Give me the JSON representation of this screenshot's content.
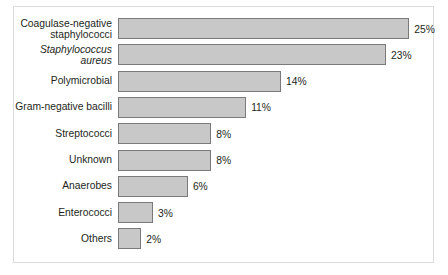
{
  "chart_data": {
    "type": "bar",
    "orientation": "horizontal",
    "title": "",
    "subtitle": "",
    "xlabel": "",
    "ylabel": "",
    "grid": false,
    "legend": null,
    "xlim": [
      0,
      25
    ],
    "value_suffix": "%",
    "categories": [
      "Coagulase-negative\nstaphylococci",
      "Staphylococcus\naureus",
      "Polymicrobial",
      "Gram-negative bacilli",
      "Streptococci",
      "Unknown",
      "Anaerobes",
      "Enterococci",
      "Others"
    ],
    "values": [
      25,
      23,
      14,
      11,
      8,
      8,
      6,
      3,
      2
    ],
    "value_labels": [
      "25%",
      "23%",
      "14%",
      "11%",
      "8%",
      "8%",
      "6%",
      "3%",
      "2%"
    ],
    "italic_categories": [
      "Staphylococcus\naureus"
    ],
    "colors": {
      "bar_fill": "#c8c8c8",
      "bar_stroke": "#7a7a7a",
      "text": "#231f20",
      "frame_border": "#dcdcdc",
      "background": "#ffffff"
    }
  }
}
